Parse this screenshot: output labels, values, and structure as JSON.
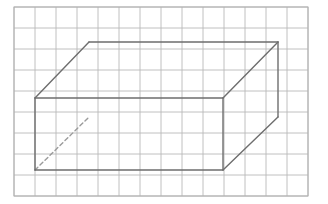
{
  "figure": {
    "canvas": {
      "width": 328,
      "height": 204,
      "background": "#ffffff"
    }
  },
  "grid": {
    "name": "graph-paper-grid",
    "origin_x": 14,
    "origin_y": 7,
    "cell_size": 21,
    "columns": 14,
    "rows": 9,
    "line_color": "#b9b9b9",
    "line_width": 0.9,
    "border_color": "#b0b0b0"
  },
  "shape": {
    "name": "rectangular-prism",
    "type": "3d-box-wireframe",
    "stroke_color": "#6e6e6e",
    "stroke_width": 1.4,
    "hidden_stroke_color": "#9b9b9b",
    "hidden_dash_pattern": "4 3",
    "front_face": {
      "label": "front-face",
      "points": "35,98 223,98 223,170 35,170"
    },
    "back_face": {
      "label": "back-face",
      "points": "89,42 278,42 278,117 89,117"
    },
    "vertices": [
      {
        "id": "front-top-left",
        "x": 35,
        "y": 98,
        "hidden": false
      },
      {
        "id": "front-top-right",
        "x": 223,
        "y": 98,
        "hidden": false
      },
      {
        "id": "front-bottom-right",
        "x": 223,
        "y": 170,
        "hidden": false
      },
      {
        "id": "front-bottom-left",
        "x": 35,
        "y": 170,
        "hidden": false
      },
      {
        "id": "back-top-left",
        "x": 89,
        "y": 42,
        "hidden": false
      },
      {
        "id": "back-top-right",
        "x": 278,
        "y": 42,
        "hidden": false
      },
      {
        "id": "back-bottom-right",
        "x": 278,
        "y": 117,
        "hidden": false
      },
      {
        "id": "back-bottom-left",
        "x": 89,
        "y": 117,
        "hidden": true
      }
    ],
    "visible_edges": [
      {
        "id": "front-top-edge",
        "d": "M 35 98 L 223 98"
      },
      {
        "id": "front-right-edge",
        "d": "M 223 98 L 223 170"
      },
      {
        "id": "front-bottom-edge",
        "d": "M 35 170 L 223 170"
      },
      {
        "id": "front-left-edge",
        "d": "M 35 98 L 35 170"
      },
      {
        "id": "back-top-edge",
        "d": "M 89 42 L 278 42"
      },
      {
        "id": "back-right-edge",
        "d": "M 278 42 L 278 117"
      },
      {
        "id": "top-left-connector",
        "d": "M 35 98 L 89 42"
      },
      {
        "id": "top-right-connector",
        "d": "M 223 98 L 278 42"
      },
      {
        "id": "bottom-right-connector",
        "d": "M 223 170 L 278 117"
      }
    ],
    "hidden_edges": [
      {
        "id": "bottom-left-connector-hidden",
        "d": "M 35 170 L 89 117"
      }
    ]
  }
}
